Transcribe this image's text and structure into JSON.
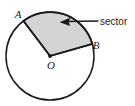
{
  "figure": {
    "background_color": "#ffffff",
    "stroke_color": "#1a1a1a",
    "sector_fill_color": "#d4d4d4"
  },
  "labels": {
    "point_a": "A",
    "point_b": "B",
    "center_o": "O",
    "callout": "sector"
  },
  "geometry": {
    "circle": {
      "center_x": 50,
      "center_y": 56,
      "radius": 44
    },
    "sector": {
      "start_angle_deg": 16,
      "end_angle_deg": 127,
      "point_a_x": 23,
      "point_a_y": 21,
      "point_b_x": 92,
      "point_b_y": 44
    },
    "callout_arrow": {
      "tail_x": 98,
      "tail_y": 21,
      "tip_x": 60,
      "tip_y": 22
    }
  }
}
